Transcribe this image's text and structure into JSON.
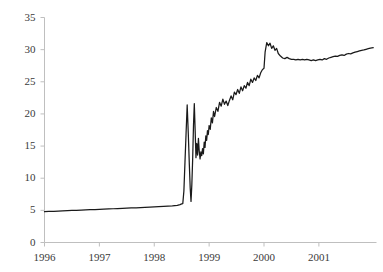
{
  "chart_data": {
    "type": "line",
    "title": "",
    "subtitle": "",
    "xlabel": "",
    "ylabel": "",
    "grid": false,
    "legend": null,
    "xlim": [
      1996.0,
      2002.05
    ],
    "ylim": [
      0,
      35
    ],
    "ytick_labels": [
      "0",
      "5",
      "10",
      "15",
      "20",
      "25",
      "30",
      "35"
    ],
    "ytick_values": [
      0,
      5,
      10,
      15,
      20,
      25,
      30,
      35
    ],
    "xtick_labels": [
      "1996",
      "1997",
      "1998",
      "1999",
      "2000",
      "2001"
    ],
    "xtick_values": [
      1996,
      1997,
      1998,
      1999,
      2000,
      2001
    ],
    "series": [
      {
        "name": "series-1",
        "color": "#1a1a1a",
        "x": [
          1996.0,
          1996.08,
          1996.17,
          1996.25,
          1996.33,
          1996.42,
          1996.5,
          1996.58,
          1996.67,
          1996.75,
          1996.83,
          1996.92,
          1997.0,
          1997.08,
          1997.17,
          1997.25,
          1997.33,
          1997.42,
          1997.5,
          1997.58,
          1997.67,
          1997.75,
          1997.83,
          1997.92,
          1998.0,
          1998.08,
          1998.17,
          1998.25,
          1998.33,
          1998.42,
          1998.47,
          1998.5,
          1998.52,
          1998.54,
          1998.56,
          1998.58,
          1998.6,
          1998.62,
          1998.64,
          1998.655,
          1998.67,
          1998.685,
          1998.7,
          1998.715,
          1998.73,
          1998.745,
          1998.76,
          1998.775,
          1998.79,
          1998.805,
          1998.82,
          1998.835,
          1998.85,
          1998.865,
          1998.88,
          1998.895,
          1998.91,
          1998.925,
          1998.94,
          1998.955,
          1998.97,
          1998.985,
          1999.0,
          1999.02,
          1999.04,
          1999.06,
          1999.08,
          1999.1,
          1999.13,
          1999.16,
          1999.19,
          1999.22,
          1999.25,
          1999.28,
          1999.31,
          1999.34,
          1999.37,
          1999.4,
          1999.43,
          1999.46,
          1999.49,
          1999.52,
          1999.55,
          1999.58,
          1999.61,
          1999.64,
          1999.67,
          1999.7,
          1999.73,
          1999.76,
          1999.79,
          1999.82,
          1999.85,
          1999.88,
          1999.91,
          1999.94,
          1999.965,
          1999.985,
          2000.0,
          2000.02,
          2000.05,
          2000.08,
          2000.11,
          2000.14,
          2000.17,
          2000.2,
          2000.23,
          2000.26,
          2000.3,
          2000.34,
          2000.38,
          2000.42,
          2000.46,
          2000.5,
          2000.54,
          2000.58,
          2000.62,
          2000.66,
          2000.7,
          2000.74,
          2000.78,
          2000.82,
          2000.86,
          2000.9,
          2000.94,
          2000.98,
          2001.02,
          2001.06,
          2001.1,
          2001.14,
          2001.18,
          2001.22,
          2001.26,
          2001.3,
          2001.34,
          2001.38,
          2001.42,
          2001.46,
          2001.5,
          2001.54,
          2001.58,
          2001.62,
          2001.66,
          2001.7,
          2001.74,
          2001.78,
          2001.82,
          2001.86,
          2001.9,
          2001.94,
          2001.99
        ],
        "y": [
          4.8,
          4.83,
          4.86,
          4.89,
          4.92,
          4.95,
          4.98,
          5.01,
          5.04,
          5.07,
          5.1,
          5.13,
          5.16,
          5.19,
          5.22,
          5.25,
          5.28,
          5.31,
          5.34,
          5.37,
          5.4,
          5.43,
          5.46,
          5.5,
          5.54,
          5.58,
          5.62,
          5.66,
          5.7,
          5.78,
          5.9,
          6.0,
          6.05,
          8.0,
          12.5,
          17.0,
          21.4,
          17.0,
          12.0,
          8.5,
          6.4,
          9.0,
          13.0,
          18.2,
          21.6,
          17.5,
          13.2,
          15.4,
          13.6,
          16.2,
          14.2,
          13.0,
          14.1,
          13.5,
          14.6,
          13.8,
          15.6,
          14.8,
          16.6,
          15.9,
          17.4,
          16.8,
          18.2,
          17.6,
          19.4,
          18.6,
          20.4,
          19.6,
          21.0,
          20.4,
          21.8,
          21.2,
          22.3,
          21.5,
          22.0,
          21.3,
          22.1,
          22.8,
          22.2,
          23.4,
          23.0,
          23.8,
          23.2,
          24.2,
          23.6,
          24.4,
          24.0,
          24.9,
          24.4,
          25.4,
          24.9,
          25.6,
          25.2,
          26.0,
          25.6,
          26.4,
          26.8,
          27.0,
          27.1,
          29.6,
          31.1,
          30.6,
          31.0,
          30.2,
          30.6,
          29.9,
          30.2,
          29.4,
          29.0,
          28.7,
          28.6,
          28.8,
          28.6,
          28.5,
          28.5,
          28.4,
          28.5,
          28.4,
          28.5,
          28.4,
          28.5,
          28.4,
          28.3,
          28.4,
          28.3,
          28.4,
          28.5,
          28.4,
          28.6,
          28.5,
          28.7,
          28.8,
          28.9,
          29.0,
          28.95,
          29.1,
          29.2,
          29.1,
          29.3,
          29.4,
          29.35,
          29.5,
          29.6,
          29.7,
          29.8,
          29.9,
          29.95,
          30.05,
          30.15,
          30.25,
          30.3
        ]
      }
    ]
  },
  "axes": {
    "axis_color": "#bfbfbf",
    "tick_color": "#bfbfbf",
    "label_color": "#3a3a3a"
  }
}
